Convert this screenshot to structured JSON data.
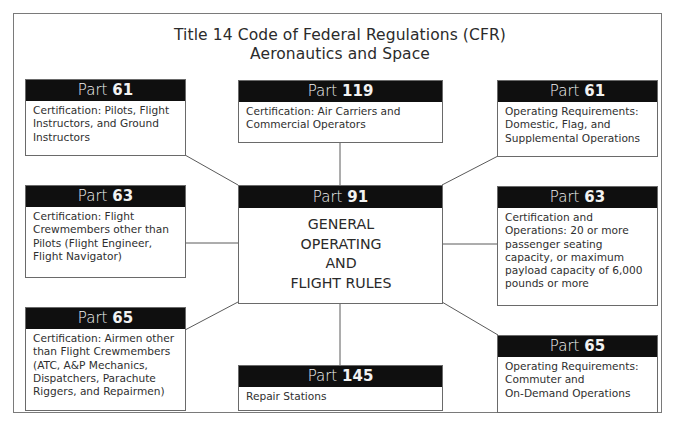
{
  "diagram": {
    "title_line1": "Title 14 Code of Federal Regulations (CFR)",
    "title_line2": "Aeronautics and Space",
    "colors": {
      "header_bg": "#0f0f0f",
      "header_text": "#f2f2f2",
      "border": "#6a6a6a",
      "connector": "#5a5a5a"
    },
    "center": {
      "prefix": "Part",
      "number": "91",
      "lines": [
        "GENERAL",
        "OPERATING",
        "AND",
        "FLIGHT RULES"
      ]
    },
    "boxes": {
      "left_top": {
        "prefix": "Part",
        "number": "61",
        "lines": [
          "Certification: Pilots, Flight",
          "Instructors, and Ground",
          "Instructors"
        ]
      },
      "left_mid": {
        "prefix": "Part",
        "number": "63",
        "lines": [
          "Certification: Flight",
          "Crewmembers other than",
          "Pilots (Flight Engineer,",
          "Flight Navigator)"
        ]
      },
      "left_bot": {
        "prefix": "Part",
        "number": "65",
        "lines": [
          "Certification: Airmen other",
          "than Flight Crewmembers",
          "(ATC, A&P Mechanics,",
          "Dispatchers, Parachute",
          "Riggers, and Repairmen)"
        ]
      },
      "center_top": {
        "prefix": "Part",
        "number": "119",
        "lines": [
          "Certification: Air Carriers and",
          "Commercial Operators"
        ]
      },
      "center_bot": {
        "prefix": "Part",
        "number": "145",
        "lines": [
          "Repair Stations"
        ]
      },
      "right_top": {
        "prefix": "Part",
        "number": "61",
        "lines": [
          "Operating Requirements:",
          "Domestic, Flag, and",
          "Supplemental Operations"
        ]
      },
      "right_mid": {
        "prefix": "Part",
        "number": "63",
        "lines": [
          "Certification and",
          "Operations: 20 or more",
          "passenger seating",
          "capacity, or maximum",
          "payload capacity of 6,000",
          "pounds or more"
        ]
      },
      "right_bot": {
        "prefix": "Part",
        "number": "65",
        "lines": [
          "Operating Requirements:",
          "Commuter and",
          "On-Demand Operations"
        ]
      }
    }
  }
}
